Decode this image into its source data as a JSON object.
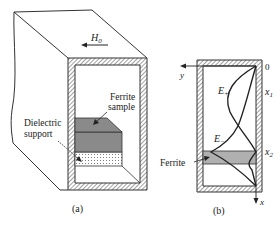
{
  "figure": {
    "panel_a": {
      "caption": "(a)",
      "field_label": "H",
      "field_subscript": "0",
      "ferrite_label_line1": "Ferrite",
      "ferrite_label_line2": "sample",
      "dielectric_label_line1": "Dielectric",
      "dielectric_label_line2": "support"
    },
    "panel_b": {
      "caption": "(b)",
      "origin_label": "0",
      "y_axis_label": "y",
      "x_axis_label": "x",
      "x1_label": "x",
      "x1_sub": "1",
      "x2_label": "x",
      "x2_sub": "2",
      "e_plus_label": "E",
      "e_plus_sub": "+",
      "e_minus_label": "E",
      "e_minus_sub": "−",
      "ferrite_label": "Ferrite"
    },
    "colors": {
      "ferrite_fill": "#8a8a8a",
      "ferrite_band": "#b0b0b0",
      "line": "#222222"
    }
  }
}
